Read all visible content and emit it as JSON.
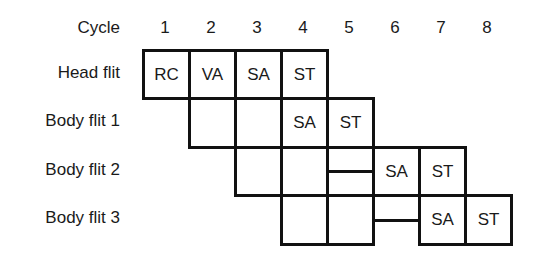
{
  "diagram": {
    "cycle_header": "Cycle",
    "cycles": [
      "1",
      "2",
      "3",
      "4",
      "5",
      "6",
      "7",
      "8"
    ],
    "rows": [
      {
        "label": "Head flit"
      },
      {
        "label": "Body flit 1"
      },
      {
        "label": "Body flit 2"
      },
      {
        "label": "Body flit 3"
      }
    ],
    "cells": {
      "head": [
        "RC",
        "VA",
        "SA",
        "ST"
      ],
      "body1": [
        "",
        "",
        "SA",
        "ST"
      ],
      "body2": [
        "",
        "",
        "",
        "SA",
        "ST"
      ],
      "body3": [
        "",
        "",
        "",
        "SA",
        "ST"
      ]
    }
  }
}
